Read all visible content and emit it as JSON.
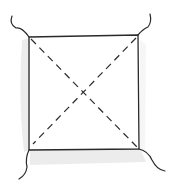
{
  "drawing": {
    "description": "Hand-drawn sketch of a square with dashed diagonals and curled lines at each corner",
    "colors": {
      "background": "#ffffff",
      "stroke": "#2a2a2a",
      "shadow": "#e6e6e6"
    },
    "square": {
      "tl": [
        29,
        37
      ],
      "tr": [
        138,
        35
      ],
      "br": [
        139,
        149
      ],
      "bl": [
        29,
        150
      ]
    }
  }
}
